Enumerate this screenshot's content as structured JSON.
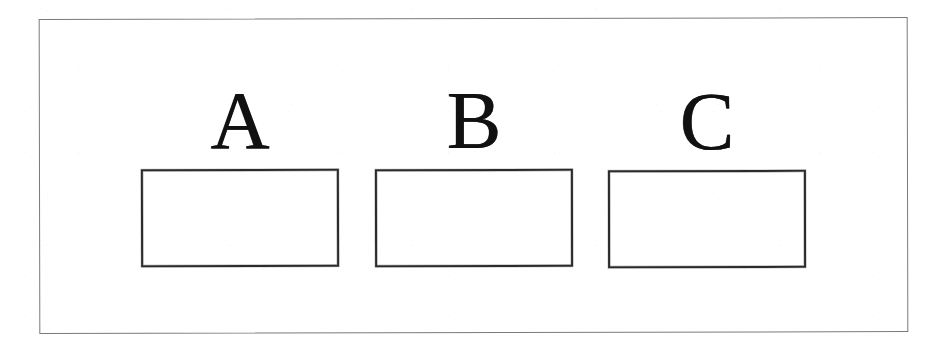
{
  "figure": {
    "type": "labelled-empty-boxes-diagram",
    "background_color": "#ffffff",
    "frame": {
      "name": "outer-border",
      "color": "#7a7a7a",
      "style": "thin single line rectangle"
    },
    "ink_color": "#1a1a1a",
    "box_border_color": "#2b2b2b",
    "columns": [
      {
        "id": "a",
        "label": "A",
        "box_content": "",
        "box_filled": false
      },
      {
        "id": "b",
        "label": "B",
        "box_content": "",
        "box_filled": false
      },
      {
        "id": "c",
        "label": "C",
        "box_content": "",
        "box_filled": false
      }
    ]
  }
}
